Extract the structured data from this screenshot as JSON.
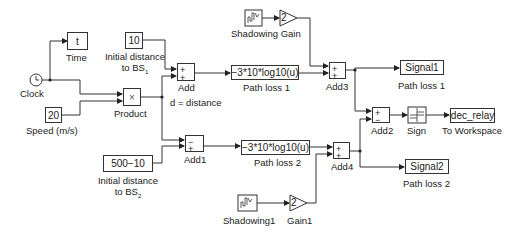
{
  "diagram": {
    "type": "simulink-model",
    "blocks": {
      "clock": {
        "label": "Clock"
      },
      "time": {
        "value": "t",
        "label": "Time"
      },
      "init_bs1": {
        "value": "10",
        "label_line1": "Initial distance",
        "label_line2": "to BS",
        "label_sub": "1"
      },
      "speed": {
        "value": "20",
        "label": "Speed (m/s)"
      },
      "product": {
        "symbol": "×",
        "label": "Product"
      },
      "add": {
        "signs": [
          "+",
          "+"
        ],
        "label": "Add"
      },
      "distance_signal": {
        "label": "d = distance"
      },
      "path_loss1": {
        "expr": "−3*10*log10(u)",
        "label": "Path loss 1"
      },
      "shadowing": {
        "label": "Shadowing Gain"
      },
      "gain": {
        "value": "2"
      },
      "add3": {
        "signs": [
          "+",
          "+"
        ],
        "label": "Add3"
      },
      "signal1": {
        "value": "Signal1",
        "label": "Path loss 1"
      },
      "add2": {
        "signs": [
          "+",
          "−"
        ],
        "label": "Add2"
      },
      "sign": {
        "label": "Sign"
      },
      "to_workspace": {
        "value": "dec_relay",
        "label": "To Workspace"
      },
      "init_bs2": {
        "value": "500−10",
        "label_line1": "Initial distance",
        "label_line2": "to BS",
        "label_sub": "2"
      },
      "add1": {
        "signs": [
          "−",
          "+"
        ],
        "label": "Add1"
      },
      "path_loss2": {
        "expr": "−3*10*log10(u)",
        "label": "Path loss 2"
      },
      "add4": {
        "signs": [
          "+",
          "+"
        ],
        "label": "Add4"
      },
      "signal2": {
        "value": "Signal2",
        "label": "Path loss 2"
      },
      "shadowing1": {
        "label": "Shadowing1"
      },
      "gain1": {
        "value": "2",
        "label": "Gain1"
      }
    },
    "colors": {
      "line": "#333333",
      "background": "#ffffff"
    }
  }
}
